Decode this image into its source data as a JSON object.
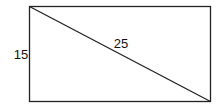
{
  "diagram": {
    "type": "rectangle-with-diagonal",
    "shape": {
      "rect": {
        "x": 29.5,
        "y": 6.5,
        "width": 181,
        "height": 95
      },
      "diagonal": {
        "x1": 29.5,
        "y1": 6.5,
        "x2": 210.5,
        "y2": 101.5
      },
      "stroke_color": "#222222",
      "fill_color": "#ffffff"
    },
    "labels": {
      "side": {
        "text": "15",
        "x": 21,
        "y": 59,
        "refers_to": "left side (height)"
      },
      "diagonal": {
        "text": "25",
        "x": 121,
        "y": 48,
        "refers_to": "diagonal"
      }
    }
  }
}
